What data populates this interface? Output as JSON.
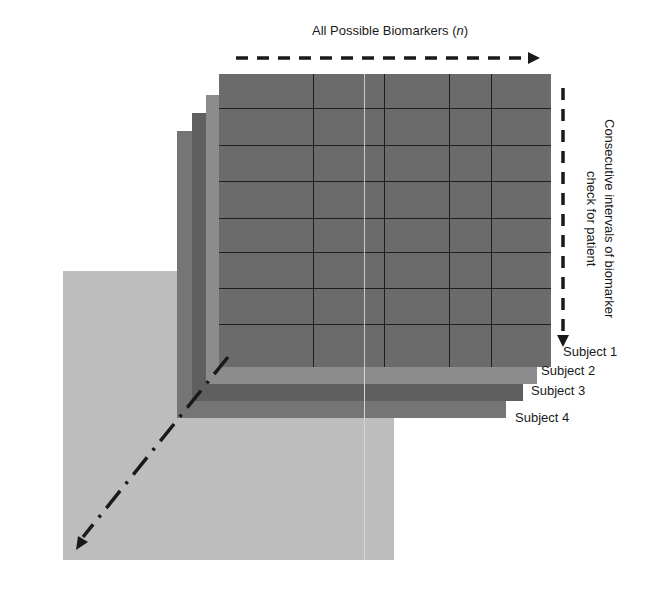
{
  "diagram": {
    "top_axis_label": "All Possible Biomarkers (",
    "top_axis_var": "n",
    "top_axis_close": ")",
    "right_axis_label_line1": "Consecutive intervals of biomarker",
    "right_axis_label_line2": "check for patient",
    "subjects": [
      {
        "label": "Subject 1",
        "color": "#6b6b6b"
      },
      {
        "label": "Subject 2",
        "color": "#8c8c8c"
      },
      {
        "label": "Subject 3",
        "color": "#5f5f5f"
      },
      {
        "label": "Subject 4",
        "color": "#757575"
      }
    ],
    "grid": {
      "rows": 8,
      "columns": 5
    },
    "base_plane_color": "#bdbdbd",
    "depth_axis": "dash-dot arrow pointing down-left"
  }
}
